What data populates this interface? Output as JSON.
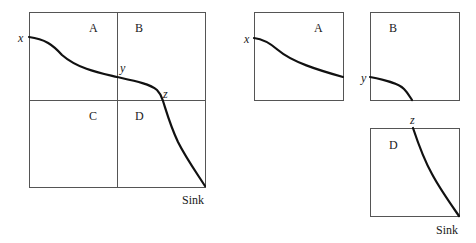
{
  "diagram": {
    "main": {
      "quadrants": [
        "A",
        "B",
        "C",
        "D"
      ],
      "points": {
        "start": "x",
        "mid": "y",
        "cross": "z",
        "end": "Sink"
      }
    },
    "panels": [
      {
        "label": "A",
        "start_point": "x"
      },
      {
        "label": "B",
        "start_point": "y"
      },
      {
        "label": "D",
        "start_point": "z",
        "end_point": "Sink"
      }
    ],
    "colors": {
      "border": "#555555",
      "curve": "#111111",
      "background": "#ffffff"
    }
  }
}
